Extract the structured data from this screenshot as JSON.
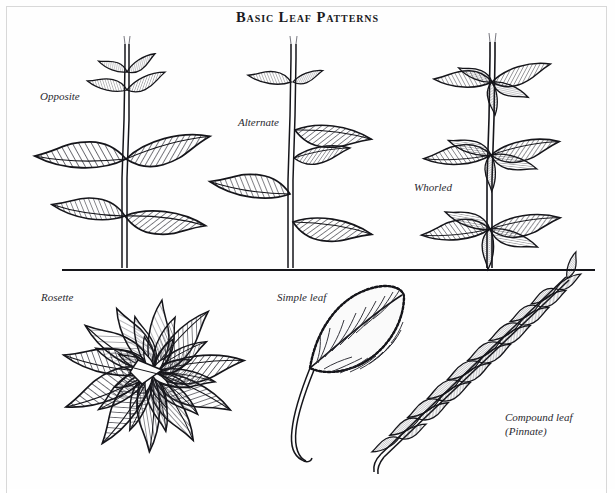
{
  "figure": {
    "title": "Basic Leaf Patterns",
    "domain": "botanical-illustration",
    "background_color": "#fefefe",
    "ink_color": "#15151a",
    "border_color": "#d8d8d8"
  },
  "labels": {
    "opposite": "Opposite",
    "alternate": "Alternate",
    "whorled": "Whorled",
    "rosette": "Rosette",
    "simple_leaf": "Simple leaf",
    "compound_leaf": "Compound leaf\n(Pinnate)"
  },
  "specimens": {
    "top_row": [
      {
        "name": "opposite",
        "label": "Opposite",
        "description": "Upright stem with leaves in pairs, two per node, directly across from each other",
        "nodes": 3,
        "leaves_per_node": 2
      },
      {
        "name": "alternate",
        "label": "Alternate",
        "description": "Upright stem with single leaves staggered on alternating sides at successive heights",
        "nodes": 5,
        "leaves_per_node": 1
      },
      {
        "name": "whorled",
        "label": "Whorled",
        "description": "Upright stem with rings of several leaves radiating from each node",
        "nodes": 3,
        "leaves_per_node": 5
      }
    ],
    "bottom_row": [
      {
        "name": "rosette",
        "label": "Rosette",
        "description": "Leaves radiating in dense overlapping circular tiers from a central crown at ground level",
        "tiers": 4
      },
      {
        "name": "simple_leaf",
        "label": "Simple leaf",
        "description": "Single undivided ovate blade with serrated margin, pinnate venation and long petiole",
        "blades": 1
      },
      {
        "name": "compound_leaf",
        "label": "Compound leaf\n(Pinnate)",
        "description": "Leaf divided into paired leaflets arranged along a central rachis with a terminal leaflet",
        "leaflet_pairs": 9,
        "terminal_leaflet": true
      }
    ]
  }
}
